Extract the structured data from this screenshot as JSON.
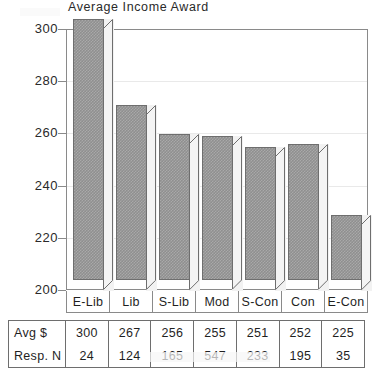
{
  "chart_data": {
    "type": "bar",
    "title": "Average Income Award",
    "xlabel": "",
    "ylabel": "",
    "ylim": [
      200,
      300
    ],
    "yticks": [
      300,
      280,
      260,
      240,
      220,
      200
    ],
    "grid": true,
    "legend": null,
    "categories": [
      "E-Lib",
      "Lib",
      "S-Lib",
      "Mod",
      "S-Con",
      "Con",
      "E-Con"
    ],
    "values": [
      300,
      267,
      256,
      255,
      251,
      252,
      225
    ],
    "series": [
      {
        "name": "Avg $",
        "values": [
          300,
          267,
          256,
          255,
          251,
          252,
          225
        ]
      }
    ],
    "annotations": {
      "table_rows": [
        {
          "label": "Avg $",
          "values": [
            300,
            267,
            256,
            255,
            251,
            252,
            225
          ]
        },
        {
          "label": "Resp. N",
          "values": [
            24,
            124,
            165,
            547,
            233,
            195,
            35
          ]
        }
      ]
    },
    "style": {
      "bar_fill": "#8f8f8f",
      "bar_edge": "#6e6e6e",
      "three_d": true
    }
  },
  "chart": {
    "title": "Average Income Award",
    "y_axis": {
      "ticks": [
        {
          "label": "300",
          "value": 300
        },
        {
          "label": "280",
          "value": 280
        },
        {
          "label": "260",
          "value": 260
        },
        {
          "label": "240",
          "value": 240
        },
        {
          "label": "220",
          "value": 220
        },
        {
          "label": "200",
          "value": 200
        }
      ]
    },
    "categories": [
      {
        "label": "E-Lib",
        "avg": "300",
        "resp": "24"
      },
      {
        "label": "Lib",
        "avg": "267",
        "resp": "124"
      },
      {
        "label": "S-Lib",
        "avg": "256",
        "resp": "165"
      },
      {
        "label": "Mod",
        "avg": "255",
        "resp": "547"
      },
      {
        "label": "S-Con",
        "avg": "251",
        "resp": "233"
      },
      {
        "label": "Con",
        "avg": "252",
        "resp": "195"
      },
      {
        "label": "E-Con",
        "avg": "225",
        "resp": "35"
      }
    ],
    "table": {
      "row_labels": [
        "Avg $",
        "Resp. N"
      ]
    }
  }
}
